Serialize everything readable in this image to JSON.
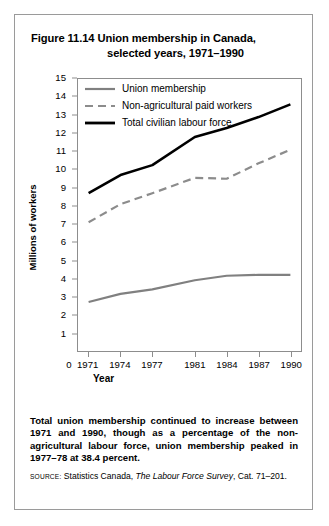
{
  "figure": {
    "title_line1": "Figure 11.14 Union membership in Canada,",
    "title_line2": "selected years, 1971–1990",
    "caption": "Total union membership continued to increase between 1971 and 1990, though as a percentage of the non-agricultural labour force, union membership peaked in 1977–78 at 38.4 percent.",
    "source_kicker": "SOURCE:",
    "source_pre": "Statistics Canada,",
    "source_italic": "The Labour Force Survey",
    "source_post": ", Cat. 71–201."
  },
  "colors": {
    "union_membership": "#808080",
    "non_agricultural": "#8c8c8c",
    "total_labour_force": "#000000",
    "frame": "#8d8d8d",
    "border": "#9a9a9a"
  },
  "chart_data": {
    "type": "line",
    "title": "Figure 11.14 Union membership in Canada, selected years, 1971–1990",
    "xlabel": "Year",
    "ylabel": "Millions of workers",
    "xlim": [
      1970,
      1991
    ],
    "ylim": [
      0,
      15
    ],
    "grid": false,
    "legend_position": "top-left inside plot",
    "x_tick_labels": [
      "0",
      "1971",
      "1974",
      "1977",
      "1981",
      "1984",
      "1987",
      "1990"
    ],
    "y_tick_labels": [
      "1",
      "2",
      "3",
      "4",
      "5",
      "6",
      "7",
      "8",
      "9",
      "10",
      "11",
      "12",
      "13",
      "14",
      "15"
    ],
    "x": [
      1971,
      1974,
      1977,
      1981,
      1984,
      1987,
      1990
    ],
    "series": [
      {
        "name": "Union membership",
        "style": "solid",
        "color": "#808080",
        "values": [
          2.7,
          3.15,
          3.4,
          3.9,
          4.15,
          4.2,
          4.2
        ]
      },
      {
        "name": "Non-agricultural paid workers",
        "style": "dashed",
        "color": "#8c8c8c",
        "values": [
          7.1,
          8.1,
          8.7,
          9.55,
          9.5,
          10.35,
          11.1
        ]
      },
      {
        "name": "Total civilian labour force",
        "style": "solid",
        "color": "#000000",
        "values": [
          8.7,
          9.7,
          10.25,
          11.8,
          12.3,
          12.9,
          13.6
        ]
      }
    ]
  }
}
